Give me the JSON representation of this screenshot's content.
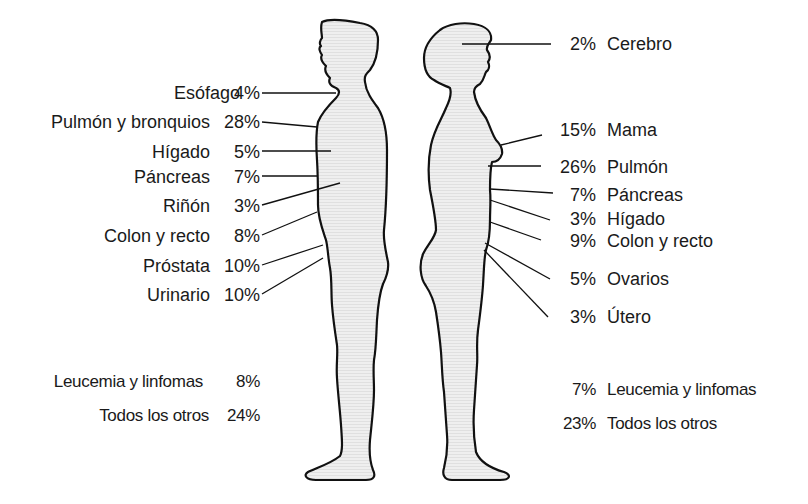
{
  "diagram": {
    "type": "anatomical-figure-labels",
    "male": {
      "title": "",
      "labels": [
        {
          "organ": "Esófago",
          "pct": "4%"
        },
        {
          "organ": "Pulmón y bronquios",
          "pct": "28%"
        },
        {
          "organ": "Hígado",
          "pct": "5%"
        },
        {
          "organ": "Páncreas",
          "pct": "7%"
        },
        {
          "organ": "Riñón",
          "pct": "3%"
        },
        {
          "organ": "Colon y recto",
          "pct": "8%"
        },
        {
          "organ": "Próstata",
          "pct": "10%"
        },
        {
          "organ": "Urinario",
          "pct": "10%"
        },
        {
          "organ": "Leucemia y linfomas",
          "pct": "8%"
        },
        {
          "organ": "Todos los otros",
          "pct": "24%"
        }
      ]
    },
    "female": {
      "title": "",
      "labels": [
        {
          "organ": "Cerebro",
          "pct": "2%"
        },
        {
          "organ": "Mama",
          "pct": "15%"
        },
        {
          "organ": "Pulmón",
          "pct": "26%"
        },
        {
          "organ": "Páncreas",
          "pct": "7%"
        },
        {
          "organ": "Hígado",
          "pct": "3%"
        },
        {
          "organ": "Colon y recto",
          "pct": "9%"
        },
        {
          "organ": "Ovarios",
          "pct": "5%"
        },
        {
          "organ": "Útero",
          "pct": "3%"
        },
        {
          "organ": "Leucemia y linfomas",
          "pct": "7%"
        },
        {
          "organ": "Todos los otros",
          "pct": "23%"
        }
      ]
    },
    "colors": {
      "outline": "#111111",
      "fill": "#ececec",
      "text": "#1a1a1a",
      "background": "#ffffff"
    }
  }
}
